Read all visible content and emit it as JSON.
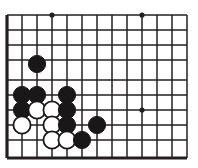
{
  "figure": {
    "kind": "go-board-diagram",
    "board": {
      "columns": 13,
      "rows": 10,
      "cell_size": 15,
      "origin_x": 7,
      "origin_y": 15,
      "line_color": "#231f20",
      "background_color": "#ffffff",
      "edge_line_width": 3.2,
      "inner_line_width": 1.5,
      "edges_thick": [
        "left",
        "bottom"
      ],
      "row_y": [
        15,
        30,
        45,
        60,
        80,
        95,
        110,
        125,
        140,
        158
      ],
      "column_x": [
        7,
        22,
        37,
        52,
        67,
        82,
        97,
        112,
        127,
        142,
        157,
        172,
        187
      ]
    },
    "star_points": [
      {
        "x": 52,
        "y": 15,
        "radius": 2.6
      },
      {
        "x": 142,
        "y": 15,
        "radius": 2.6
      },
      {
        "x": 142,
        "y": 110,
        "radius": 2.6
      }
    ],
    "stone_radius": 8.6,
    "stones": [
      {
        "color": "black",
        "x": 37,
        "y": 64
      },
      {
        "color": "black",
        "x": 22,
        "y": 95
      },
      {
        "color": "black",
        "x": 37,
        "y": 95
      },
      {
        "color": "black",
        "x": 67,
        "y": 95
      },
      {
        "color": "black",
        "x": 22,
        "y": 110
      },
      {
        "color": "white",
        "x": 37,
        "y": 110
      },
      {
        "color": "white",
        "x": 52,
        "y": 110
      },
      {
        "color": "black",
        "x": 67,
        "y": 110
      },
      {
        "color": "white",
        "x": 22,
        "y": 125
      },
      {
        "color": "white",
        "x": 52,
        "y": 125
      },
      {
        "color": "black",
        "x": 67,
        "y": 125
      },
      {
        "color": "black",
        "x": 97,
        "y": 125
      },
      {
        "color": "white",
        "x": 52,
        "y": 140
      },
      {
        "color": "white",
        "x": 67,
        "y": 140
      },
      {
        "color": "black",
        "x": 82,
        "y": 140
      }
    ],
    "counts": {
      "black_stones": 9,
      "white_stones": 6,
      "total_stones": 15
    }
  }
}
